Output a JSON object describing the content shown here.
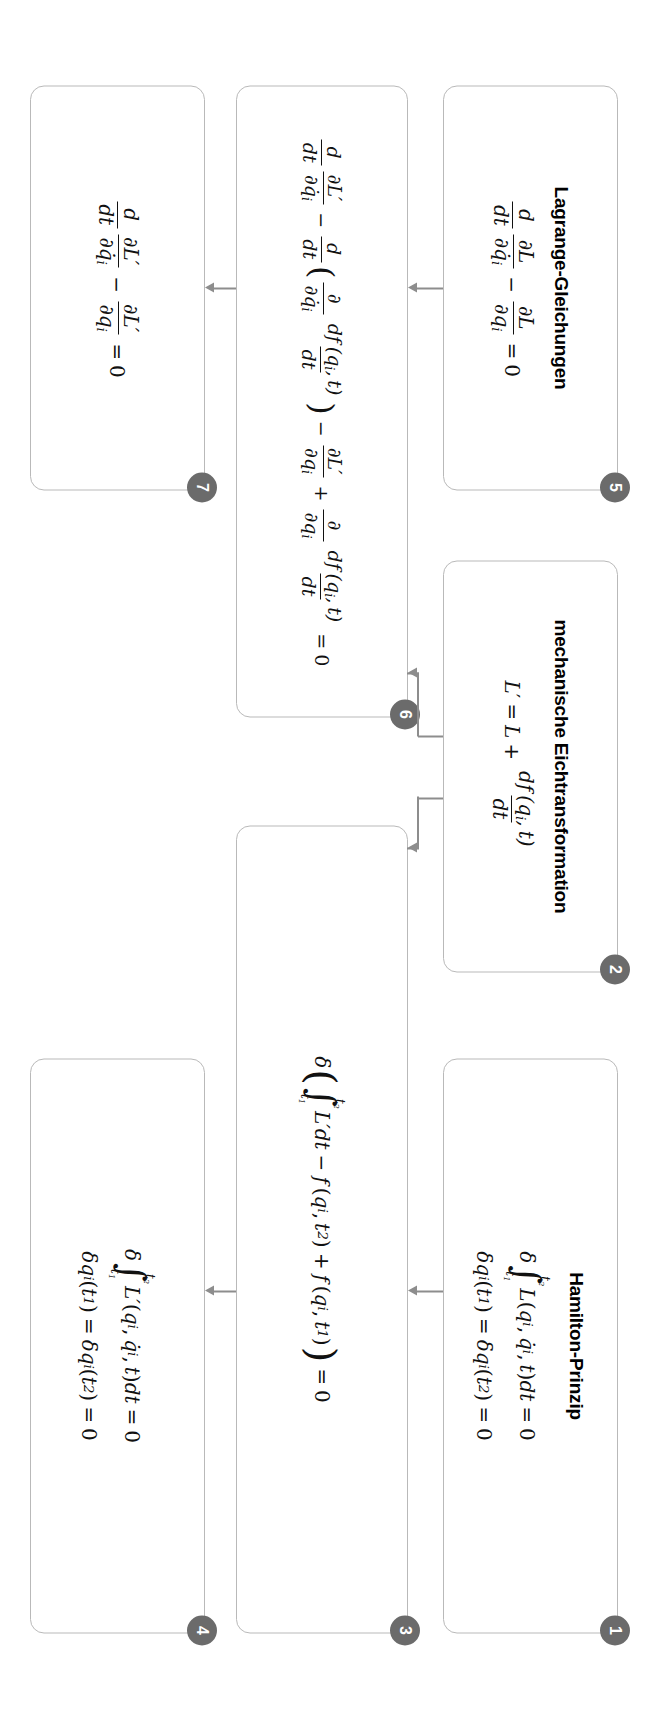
{
  "diagram": {
    "language": "de",
    "orientation": "rotated-90",
    "colors": {
      "badge_fill": "#6b6b6b",
      "badge_text": "#ffffff",
      "box_border": "#b9b9b9",
      "connector": "#8d8d8d",
      "background": "#ffffff",
      "text": "#111111"
    },
    "nodes": [
      {
        "id": "node-1",
        "badge": "1",
        "title": "Hamilton-Prinzip",
        "equations": [
          "δ ∫_{t₁}^{t₂} L(qᵢ, q̇ᵢ, t) dt = 0",
          "δqᵢ(t₁) = δqᵢ(t₂) = 0"
        ]
      },
      {
        "id": "node-2",
        "badge": "2",
        "title": "mechanische Eichtransformation",
        "equations": [
          "L' = L + df(qᵢ, t)/dt"
        ]
      },
      {
        "id": "node-3",
        "badge": "3",
        "title": "",
        "equations": [
          "δ( ∫_{t₁}^{t₂} L'dt − f(qᵢ, t₂) + f(qᵢ, t₁) ) = 0"
        ]
      },
      {
        "id": "node-4",
        "badge": "4",
        "title": "",
        "equations": [
          "δ ∫_{t₁}^{t₂} L'(qᵢ, q̇ᵢ, t) dt = 0",
          "δqᵢ(t₁) = δqᵢ(t₂) = 0"
        ]
      },
      {
        "id": "node-5",
        "badge": "5",
        "title": "Lagrange-Gleichungen",
        "equations": [
          "d/dt ∂L/∂q̇ᵢ − ∂L/∂qᵢ = 0"
        ]
      },
      {
        "id": "node-6",
        "badge": "6",
        "title": "",
        "equations": [
          "d/dt ∂L'/∂q̇ᵢ − d/dt ( ∂/∂q̇ᵢ df(qᵢ, t)/dt ) − ∂L'/∂qᵢ + ∂/∂qᵢ df(qᵢ, t)/dt = 0"
        ]
      },
      {
        "id": "node-7",
        "badge": "7",
        "title": "",
        "equations": [
          "d/dt ∂L'/∂q̇ᵢ − ∂L'/∂qᵢ = 0"
        ]
      }
    ],
    "symbols": {
      "delta": "δ",
      "partial": "∂",
      "integral": "∫",
      "minus": "−",
      "plus": "+",
      "equals": "=",
      "zero": "0",
      "d": "d",
      "dt": "dt",
      "t": "t",
      "t1": "t₁",
      "t2": "t₂",
      "L": "L",
      "Lprime": "L′",
      "f": "f",
      "q_i": "q",
      "i": "i",
      "qdot": "q̇",
      "paren_open": "(",
      "paren_close": ")",
      "comma": ","
    },
    "edges": [
      {
        "from": "node-1",
        "to": "node-3",
        "type": "arrow"
      },
      {
        "from": "node-3",
        "to": "node-4",
        "type": "arrow"
      },
      {
        "from": "node-2",
        "to": "node-3",
        "type": "arrow"
      },
      {
        "from": "node-2",
        "to": "node-6",
        "type": "arrow"
      },
      {
        "from": "node-5",
        "to": "node-6",
        "type": "arrow"
      },
      {
        "from": "node-6",
        "to": "node-7",
        "type": "arrow"
      }
    ]
  }
}
